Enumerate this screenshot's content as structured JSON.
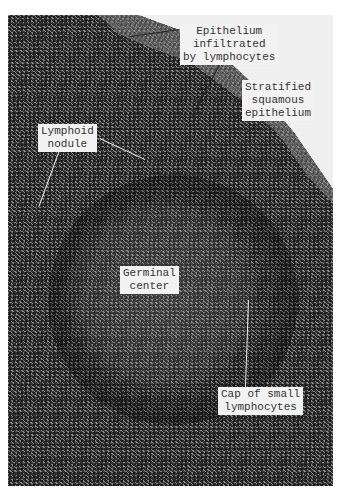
{
  "figure": {
    "labels": [
      {
        "id": "epithelium-infiltrated",
        "lines": [
          "Epithelium",
          "infiltrated",
          "by lymphocytes"
        ]
      },
      {
        "id": "stratified-squamous",
        "lines": [
          "Stratified",
          "squamous",
          "epithelium"
        ]
      },
      {
        "id": "lymphoid-nodule",
        "lines": [
          "Lymphoid",
          "nodule"
        ]
      },
      {
        "id": "germinal-center",
        "lines": [
          "Germinal",
          "center"
        ]
      },
      {
        "id": "cap-small-lymphocytes",
        "lines": [
          "Cap of small",
          "lymphocytes"
        ]
      }
    ]
  }
}
